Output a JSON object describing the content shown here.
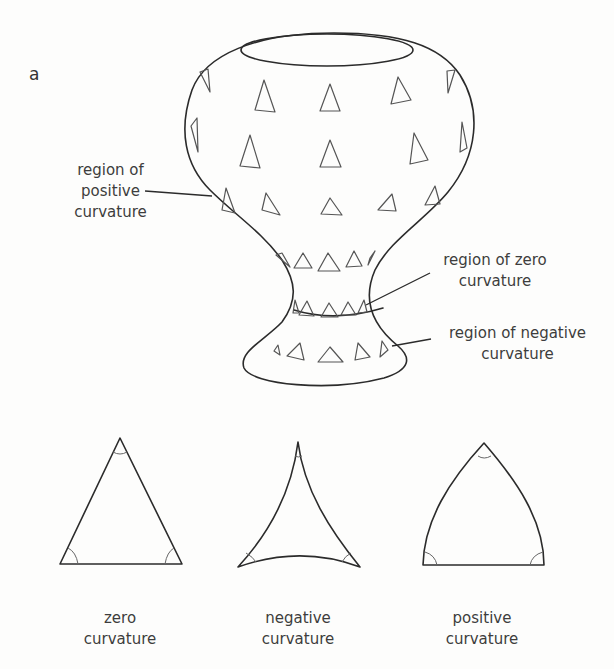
{
  "figure": {
    "panel_letter": "a",
    "labels": {
      "positive_region": [
        "region of",
        "positive",
        "curvature"
      ],
      "zero_region": [
        "region of zero",
        "curvature"
      ],
      "negative_region": [
        "region of negative",
        "curvature"
      ]
    },
    "triangles": [
      {
        "kind": "zero",
        "label": [
          "zero",
          "curvature"
        ]
      },
      {
        "kind": "negative",
        "label": [
          "negative",
          "curvature"
        ]
      },
      {
        "kind": "positive",
        "label": [
          "positive",
          "curvature"
        ]
      }
    ],
    "colors": {
      "stroke": "#2b2b2b",
      "marker": "#555555",
      "background": "#fdfdfc"
    }
  }
}
